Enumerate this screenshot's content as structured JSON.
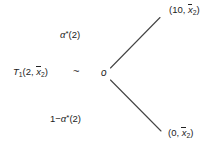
{
  "diagram": {
    "type": "lottery-indifference-tree",
    "background_color": "#ffffff",
    "line_color": "#444444",
    "text_color": "#222222",
    "left_node": {
      "symbol": "T",
      "subscript": "1",
      "args_open": "(2, ",
      "arg_bar_var": "x",
      "arg_bar_sub": "2",
      "args_close": ")"
    },
    "relation_symbol": "~",
    "center_node_label": "o",
    "branches": [
      {
        "name": "upper-branch",
        "probability": {
          "prefix": "",
          "greek": "α",
          "star": "*",
          "arg": "(2)"
        },
        "outcome": {
          "open": "(10, ",
          "bar_var": "x",
          "bar_sub": "2",
          "close": ")"
        }
      },
      {
        "name": "lower-branch",
        "probability": {
          "prefix": "1−",
          "greek": "α",
          "star": "*",
          "arg": "(2)"
        },
        "outcome": {
          "open": "(0, ",
          "bar_var": "x",
          "bar_sub": "2",
          "close": ")"
        }
      }
    ]
  }
}
